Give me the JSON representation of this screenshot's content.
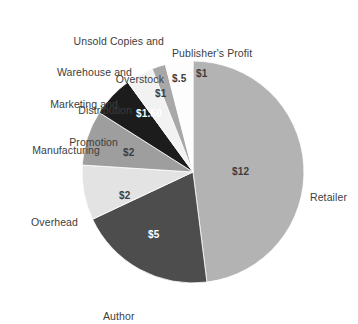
{
  "chart_data": {
    "type": "pie",
    "title": "",
    "subtitle": "",
    "xlabel": "",
    "ylabel": "",
    "legend_position": "none",
    "grid": false,
    "units": "US dollars per book",
    "total": 24,
    "start_angle_deg": 0,
    "direction": "clockwise",
    "categories": [
      "Retailer",
      "Author",
      "Overhead",
      "Manufacturing",
      "Marketing and Promotion",
      "Warehouse and Distribution",
      "Unsold Copies and Overstock",
      "Publisher's Profit"
    ],
    "values": [
      12,
      5,
      2,
      2,
      1.5,
      1,
      0.5,
      1
    ],
    "value_labels": [
      "$12",
      "$5",
      "$2",
      "$2",
      "$1.50",
      "$1",
      "$.5",
      "$1"
    ],
    "colors": [
      "#b3b3b3",
      "#4d4d4d",
      "#e3e3e3",
      "#9e9e9e",
      "#1c1c1c",
      "#f2f2f2",
      "#a8a8a8",
      "#fdfdfd"
    ],
    "slices": [
      {
        "name": "Retailer",
        "value": 12,
        "value_label": "$12",
        "color": "#b3b3b3",
        "label_text_color": "#2b2b2b",
        "start_deg": 0,
        "sweep_deg": 180
      },
      {
        "name": "Author",
        "value": 5,
        "value_label": "$5",
        "color": "#4d4d4d",
        "label_text_color": "#ffffff",
        "start_deg": 180,
        "sweep_deg": 75
      },
      {
        "name": "Overhead",
        "value": 2,
        "value_label": "$2",
        "color": "#e3e3e3",
        "label_text_color": "#2b2b2b",
        "start_deg": 255,
        "sweep_deg": 30
      },
      {
        "name": "Manufacturing",
        "value": 2,
        "value_label": "$2",
        "color": "#9e9e9e",
        "label_text_color": "#2b2b2b",
        "start_deg": 285,
        "sweep_deg": 30
      },
      {
        "name": "Marketing and Promotion",
        "value": 1.5,
        "value_label": "$1.50",
        "color": "#1c1c1c",
        "label_text_color": "#ffffff",
        "start_deg": 315,
        "sweep_deg": 22.5
      },
      {
        "name": "Warehouse and Distribution",
        "value": 1,
        "value_label": "$1",
        "color": "#f2f2f2",
        "label_text_color": "#2b2b2b",
        "start_deg": 337.5,
        "sweep_deg": 15
      },
      {
        "name": "Unsold Copies and Overstock",
        "value": 0.5,
        "value_label": "$.5",
        "color": "#a8a8a8",
        "label_text_color": "#2b2b2b",
        "start_deg": 352.5,
        "sweep_deg": 7.5
      },
      {
        "name": "Publisher's Profit",
        "value": 1,
        "value_label": "$1",
        "color": "#fdfdfd",
        "label_text_color": "#2b2b2b",
        "start_deg": 0,
        "sweep_deg": 0
      }
    ]
  },
  "geometry": {
    "center_x": 193,
    "center_y": 172,
    "radius": 111
  },
  "callout_labels": {
    "unsold_copies": {
      "line1": "Unsold Copies and",
      "line2": "Overstock"
    },
    "publishers_profit": {
      "line1": "Publisher's Profit"
    },
    "warehouse": {
      "line1": "Warehouse and",
      "line2": "Distribution"
    },
    "marketing": {
      "line1": "Marketing and",
      "line2": "Promotion"
    },
    "manufacturing": {
      "line1": "Manufacturing"
    },
    "overhead": {
      "line1": "Overhead"
    },
    "author": {
      "line1": "Author"
    },
    "retailer": {
      "line1": "Retailer"
    }
  },
  "slice_value_labels": {
    "retailer": "$12",
    "author": "$5",
    "overhead": "$2",
    "manufacturing": "$2",
    "marketing": "$1.50",
    "warehouse": "$1",
    "unsold": "$.5",
    "publisher": "$1"
  }
}
